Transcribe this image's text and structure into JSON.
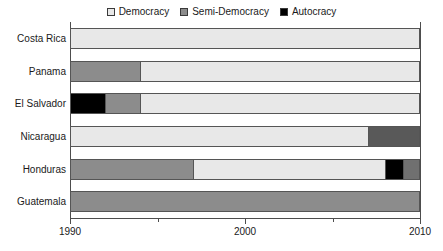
{
  "chart_data": {
    "type": "bar",
    "orientation": "horizontal",
    "subtype": "stacked-timeline",
    "title": "",
    "xlabel": "",
    "ylabel": "",
    "xlim": [
      1990,
      2010
    ],
    "grid": false,
    "legend_position": "top-center",
    "legend": [
      {
        "label": "Democracy",
        "color": "#e8e8e8"
      },
      {
        "label": "Semi-Democracy",
        "color": "#8c8c8c"
      },
      {
        "label": "Autocracy",
        "color": "#000000"
      }
    ],
    "x_ticks": [
      {
        "value": 1990,
        "label": "1990",
        "major": true
      },
      {
        "value": 1995,
        "label": "",
        "major": false
      },
      {
        "value": 2000,
        "label": "2000",
        "major": true
      },
      {
        "value": 2005,
        "label": "",
        "major": false
      },
      {
        "value": 2010,
        "label": "2010",
        "major": true
      }
    ],
    "categories": [
      "Costa Rica",
      "Panama",
      "El Salvador",
      "Nicaragua",
      "Honduras",
      "Guatemala"
    ],
    "rows": [
      {
        "label": "Costa Rica",
        "segments": [
          {
            "regime": "Democracy",
            "start": 1990,
            "end": 2010,
            "color": "#e8e8e8"
          }
        ]
      },
      {
        "label": "Panama",
        "segments": [
          {
            "regime": "Semi-Democracy",
            "start": 1990,
            "end": 1994,
            "color": "#8c8c8c"
          },
          {
            "regime": "Democracy",
            "start": 1994,
            "end": 2010,
            "color": "#e8e8e8"
          }
        ]
      },
      {
        "label": "El Salvador",
        "segments": [
          {
            "regime": "Autocracy",
            "start": 1990,
            "end": 1992,
            "color": "#000000"
          },
          {
            "regime": "Semi-Democracy",
            "start": 1992,
            "end": 1994,
            "color": "#8c8c8c"
          },
          {
            "regime": "Democracy",
            "start": 1994,
            "end": 2010,
            "color": "#e8e8e8"
          }
        ]
      },
      {
        "label": "Nicaragua",
        "segments": [
          {
            "regime": "Democracy",
            "start": 1990,
            "end": 2007,
            "color": "#e8e8e8"
          },
          {
            "regime": "Semi-Democracy",
            "start": 2007,
            "end": 2010,
            "color": "#595959"
          }
        ]
      },
      {
        "label": "Honduras",
        "segments": [
          {
            "regime": "Semi-Democracy",
            "start": 1990,
            "end": 1997,
            "color": "#8c8c8c"
          },
          {
            "regime": "Democracy",
            "start": 1997,
            "end": 2008,
            "color": "#e8e8e8"
          },
          {
            "regime": "Autocracy",
            "start": 2008,
            "end": 2009,
            "color": "#000000"
          },
          {
            "regime": "Semi-Democracy",
            "start": 2009,
            "end": 2010,
            "color": "#707070"
          }
        ]
      },
      {
        "label": "Guatemala",
        "segments": [
          {
            "regime": "Semi-Democracy",
            "start": 1990,
            "end": 2010,
            "color": "#8c8c8c"
          }
        ]
      }
    ]
  }
}
